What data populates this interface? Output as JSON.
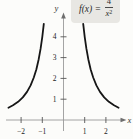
{
  "figure": {
    "background_color": "#fcfcfa"
  },
  "formula": {
    "lhs": "f(x)",
    "equals": "=",
    "numerator": "4",
    "denominator_base": "x",
    "denominator_exponent": "2",
    "background_color": "#e8e7e3"
  },
  "chart_data": {
    "type": "line",
    "function": "f(x) = 4/x^2",
    "title": "",
    "xlabel": "x",
    "ylabel": "y",
    "xlim": [
      -2.9,
      3.0
    ],
    "ylim": [
      0,
      5.1
    ],
    "x_tick_values": [
      -2,
      -1,
      1,
      2
    ],
    "x_tick_labels": [
      "−2",
      "−1",
      "1",
      "2"
    ],
    "y_tick_values": [
      1,
      2,
      3,
      4
    ],
    "y_tick_labels": [
      "1",
      "2",
      "3",
      "4"
    ],
    "grid": false,
    "legend": false,
    "colors": {
      "curve": "#161616",
      "axis": "#9a9a9a",
      "tick": "#555555",
      "tick_label": "#222222",
      "axis_label": "#333333",
      "arrow": "#6e6e6e"
    },
    "series": [
      {
        "name": "left-branch",
        "points": [
          [
            -2.6,
            0.592
          ],
          [
            -2.38,
            0.706
          ],
          [
            -2.14,
            0.873
          ],
          [
            -1.92,
            1.085
          ],
          [
            -1.72,
            1.352
          ],
          [
            -1.55,
            1.665
          ],
          [
            -1.4,
            2.041
          ],
          [
            -1.28,
            2.441
          ],
          [
            -1.17,
            2.922
          ],
          [
            -1.08,
            3.429
          ],
          [
            -1.0,
            4.0
          ],
          [
            -0.93,
            4.625
          ]
        ]
      },
      {
        "name": "right-branch",
        "points": [
          [
            0.93,
            4.625
          ],
          [
            1.0,
            4.0
          ],
          [
            1.08,
            3.429
          ],
          [
            1.17,
            2.922
          ],
          [
            1.28,
            2.441
          ],
          [
            1.4,
            2.041
          ],
          [
            1.55,
            1.665
          ],
          [
            1.72,
            1.352
          ],
          [
            1.92,
            1.085
          ],
          [
            2.14,
            0.873
          ],
          [
            2.38,
            0.706
          ],
          [
            2.6,
            0.592
          ]
        ]
      }
    ]
  }
}
